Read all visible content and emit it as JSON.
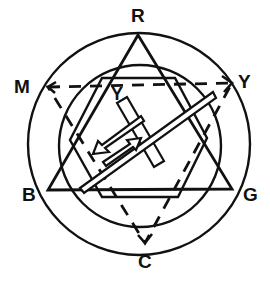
{
  "diagram": {
    "labels": {
      "top": "R",
      "upper_left": "M",
      "upper_right": "Y",
      "lower_left": "B",
      "lower_right": "G",
      "bottom": "C",
      "center": "Y"
    },
    "elements": {
      "outer_circle": "outer-ring",
      "inner_circle": "inner-ring",
      "solid_triangle_vertices": [
        "R",
        "B",
        "G"
      ],
      "dashed_triangle_vertices": [
        "M",
        "Y",
        "C"
      ],
      "hexagon": "center-hexagon",
      "filter_bar": "rotated-rectangle",
      "arrow": "double-headed-open-arrow"
    },
    "colors": {
      "line": "#111111",
      "background": "#ffffff"
    }
  }
}
